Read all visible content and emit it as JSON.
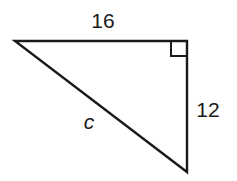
{
  "diagram": {
    "type": "right-triangle",
    "labels": {
      "top_side": "16",
      "right_side": "12",
      "hypotenuse": "c"
    },
    "right_angle_marker": true,
    "colors": {
      "stroke": "#1a1a1a",
      "background": "#ffffff"
    }
  }
}
